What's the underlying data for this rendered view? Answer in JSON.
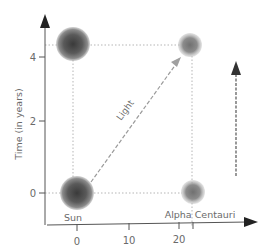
{
  "diagram": {
    "y_axis": {
      "label": "Time (in years)",
      "ticks": [
        {
          "value": "0",
          "y": 193
        },
        {
          "value": "2",
          "y": 121
        },
        {
          "value": "4",
          "y": 57
        }
      ]
    },
    "x_axis": {
      "ticks": [
        {
          "value": "0",
          "x": 77
        },
        {
          "value": "10",
          "x": 129
        },
        {
          "value": "20",
          "x": 178
        }
      ]
    },
    "labels": {
      "sun": "Sun",
      "alpha_centauri": "Alpha Centauri",
      "light": "Light"
    },
    "colors": {
      "axis": "#555555",
      "text": "#6a6a6a",
      "dotted": "#b0b0b0",
      "arrow": "#444444",
      "sphere_dark": "#3a3a3a",
      "sphere_light": "#9a9a9a"
    }
  }
}
